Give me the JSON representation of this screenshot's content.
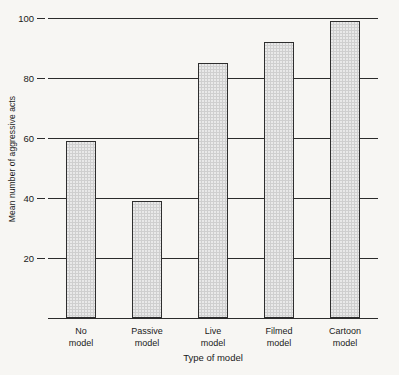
{
  "chart_data": {
    "type": "bar",
    "title": "",
    "xlabel": "Type of model",
    "ylabel": "Mean number of aggressive acts",
    "categories": [
      "No model",
      "Passive model",
      "Live model",
      "Filmed model",
      "Cartoon model"
    ],
    "category_lines": [
      [
        "No",
        "model"
      ],
      [
        "Passive",
        "model"
      ],
      [
        "Live",
        "model"
      ],
      [
        "Filmed",
        "model"
      ],
      [
        "Cartoon",
        "model"
      ]
    ],
    "values": [
      59,
      39,
      85,
      92,
      99
    ],
    "ylim": [
      0,
      100
    ],
    "yticks": [
      20,
      40,
      60,
      80,
      100
    ],
    "ytick_labels": [
      "20",
      "40",
      "60",
      "80",
      "100"
    ],
    "grid": true,
    "legend": null,
    "bar_fill_color": "#cfcfcf",
    "bar_edge_color": "#2e2e2e",
    "axis_color": "#2b2b2b",
    "background_color": "#f7f6f3"
  }
}
